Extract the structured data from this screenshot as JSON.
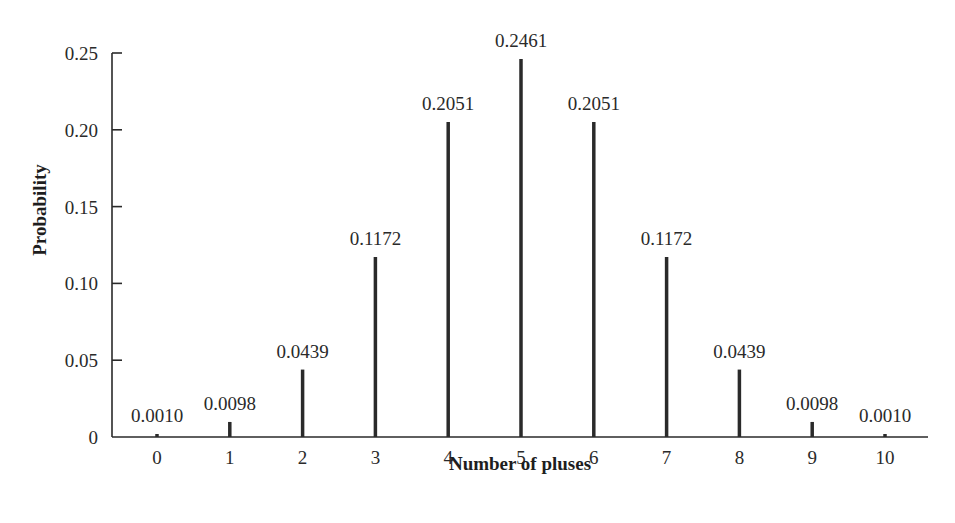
{
  "chart_data": {
    "type": "bar",
    "title": "",
    "xlabel": "Number of pluses",
    "ylabel": "Probability",
    "categories": [
      "0",
      "1",
      "2",
      "3",
      "4",
      "5",
      "6",
      "7",
      "8",
      "9",
      "10"
    ],
    "values": [
      0.001,
      0.0098,
      0.0439,
      0.1172,
      0.2051,
      0.2461,
      0.2051,
      0.1172,
      0.0439,
      0.0098,
      0.001
    ],
    "data_labels": [
      "0.0010",
      "0.0098",
      "0.0439",
      "0.1172",
      "0.2051",
      "0.2461",
      "0.2051",
      "0.1172",
      "0.0439",
      "0.0098",
      "0.0010"
    ],
    "yticks": [
      0,
      0.05,
      0.1,
      0.15,
      0.2,
      0.25
    ],
    "ytick_labels": [
      "0",
      "0.05",
      "0.10",
      "0.15",
      "0.20",
      "0.25"
    ],
    "ylim": [
      0,
      0.25
    ],
    "grid": false,
    "legend": null,
    "style": "spike / line bars",
    "colors": {
      "bars": "#2a2a2a",
      "axes": "#2a2a2a",
      "background": "#ffffff"
    }
  }
}
